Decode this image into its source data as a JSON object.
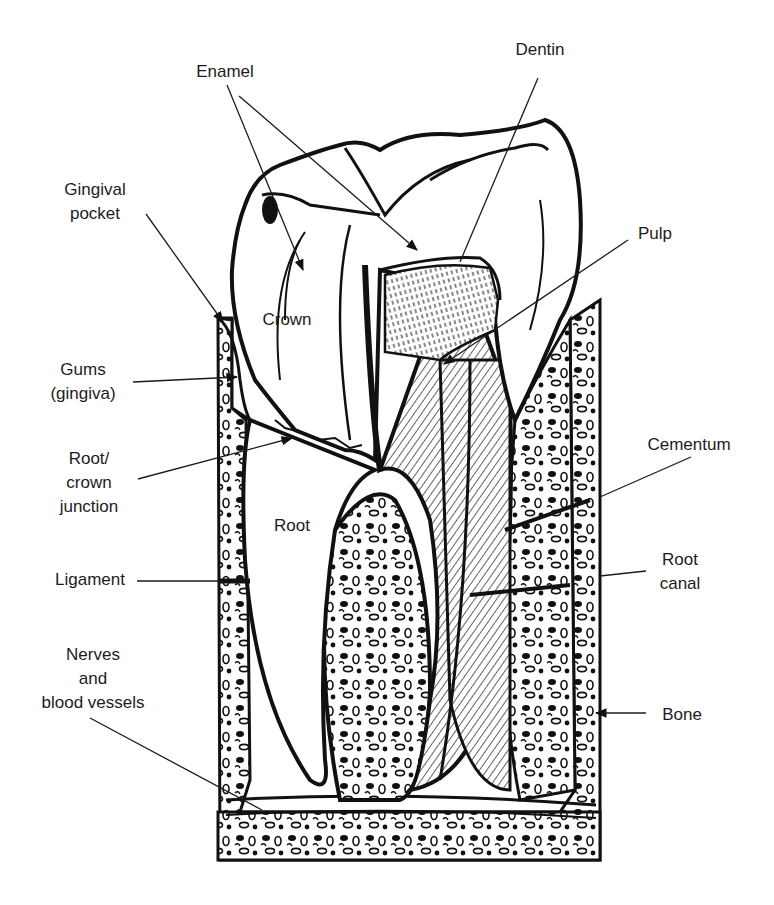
{
  "diagram": {
    "colors": {
      "ink": "#111111",
      "label": "#1c1c1c",
      "background": "#ffffff"
    },
    "labels": {
      "enamel": {
        "lines": [
          "Enamel"
        ]
      },
      "dentin": {
        "lines": [
          "Dentin"
        ]
      },
      "gingival_pocket": {
        "lines": [
          "Gingival",
          "pocket"
        ]
      },
      "pulp": {
        "lines": [
          "Pulp"
        ]
      },
      "crown": {
        "lines": [
          "Crown"
        ]
      },
      "gums": {
        "lines": [
          "Gums",
          "(gingiva)"
        ]
      },
      "root_crown_junction": {
        "lines": [
          "Root/",
          "crown",
          "junction"
        ]
      },
      "cementum": {
        "lines": [
          "Cementum"
        ]
      },
      "root": {
        "lines": [
          "Root"
        ]
      },
      "ligament": {
        "lines": [
          "Ligament"
        ]
      },
      "root_canal": {
        "lines": [
          "Root",
          "canal"
        ]
      },
      "nerves": {
        "lines": [
          "Nerves",
          "and",
          "blood vessels"
        ]
      },
      "bone": {
        "lines": [
          "Bone"
        ]
      }
    }
  }
}
